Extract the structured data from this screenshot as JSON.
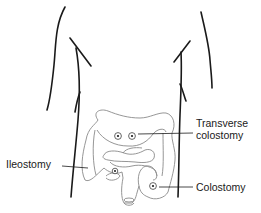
{
  "diagram": {
    "labels": {
      "transverse_line1": "Transverse",
      "transverse_line2": "colostomy",
      "ileostomy": "Ileostomy",
      "colostomy": "Colostomy"
    },
    "colors": {
      "body_outline": "#1a1a1a",
      "intestine_outline": "#8a8a8a",
      "leader_line": "#1a1a1a",
      "text": "#1a1a1a"
    },
    "stomas": [
      {
        "name": "transverse-colostomy-left",
        "x": 118,
        "y": 136
      },
      {
        "name": "transverse-colostomy-right",
        "x": 132,
        "y": 136
      },
      {
        "name": "ileostomy",
        "x": 115,
        "y": 171
      },
      {
        "name": "colostomy",
        "x": 153,
        "y": 186
      }
    ]
  }
}
